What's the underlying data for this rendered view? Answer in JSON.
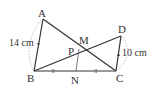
{
  "diagram": {
    "type": "geometry",
    "points": {
      "A": {
        "label": "A",
        "x": 43,
        "y": 19
      },
      "B": {
        "label": "B",
        "x": 34,
        "y": 71
      },
      "C": {
        "label": "C",
        "x": 116,
        "y": 71
      },
      "D": {
        "label": "D",
        "x": 121,
        "y": 36
      },
      "N": {
        "label": "N",
        "x": 76,
        "y": 71
      },
      "M": {
        "label": "M",
        "x": 84,
        "y": 50
      },
      "P": {
        "label": "P",
        "x": 79,
        "y": 53
      }
    },
    "segments": [
      "AB",
      "AC",
      "BD",
      "DC",
      "BC",
      "NM"
    ],
    "measurements": {
      "AB": "14 cm",
      "DC": "10 cm"
    },
    "tick_marks": "BN = NC (double ticks)",
    "stroke_color": "#333333",
    "dashed_color": "#999999"
  }
}
